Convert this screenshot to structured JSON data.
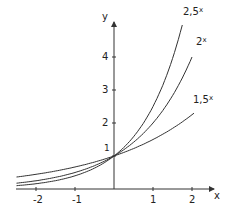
{
  "chart_data": {
    "type": "line",
    "title": "",
    "xlabel": "x",
    "ylabel": "y",
    "x_ticks": [
      "-2",
      "-1",
      "1",
      "2"
    ],
    "y_ticks": [
      "1",
      "2",
      "3",
      "4"
    ],
    "xlim": [
      -2.5,
      2.4
    ],
    "ylim": [
      0,
      5
    ],
    "grid": false,
    "series": [
      {
        "name": "2,5^x",
        "base": 2.5,
        "label_base": "2,5",
        "label_exp": "x"
      },
      {
        "name": "2^x",
        "base": 2,
        "label_base": "2",
        "label_exp": "x"
      },
      {
        "name": "1,5^x",
        "base": 1.5,
        "label_base": "1,5",
        "label_exp": "x"
      }
    ],
    "annotations": [
      {
        "text": "1",
        "at": [
          0,
          1
        ]
      }
    ]
  }
}
